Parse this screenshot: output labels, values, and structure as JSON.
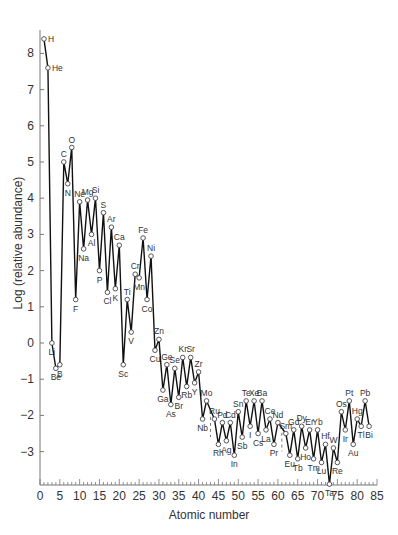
{
  "chart_data": {
    "type": "line",
    "title": "",
    "xlabel": "Atomic number",
    "ylabel": "Log (relative abundance)",
    "xlim": [
      0,
      85
    ],
    "ylim": [
      -3.9,
      8.6
    ],
    "xticks": [
      0,
      5,
      10,
      15,
      20,
      25,
      30,
      35,
      40,
      45,
      50,
      55,
      60,
      65,
      70,
      75,
      80,
      85
    ],
    "yticks": [
      -3,
      -2,
      -1,
      0,
      1,
      2,
      3,
      4,
      5,
      6,
      7,
      8
    ],
    "grid": false,
    "legend": null,
    "series": [
      {
        "name": "Solar system elemental abundance",
        "points": [
          {
            "z": 1,
            "el": "H",
            "v": 8.4
          },
          {
            "z": 2,
            "el": "He",
            "v": 7.6
          },
          {
            "z": 3,
            "el": "Li",
            "v": 0.0
          },
          {
            "z": 4,
            "el": "Be",
            "v": -0.7
          },
          {
            "z": 5,
            "el": "B",
            "v": -0.6
          },
          {
            "z": 6,
            "el": "C",
            "v": 5.0
          },
          {
            "z": 7,
            "el": "N",
            "v": 4.4
          },
          {
            "z": 8,
            "el": "O",
            "v": 5.4
          },
          {
            "z": 9,
            "el": "F",
            "v": 1.2
          },
          {
            "z": 10,
            "el": "Ne",
            "v": 3.9
          },
          {
            "z": 11,
            "el": "Na",
            "v": 2.6
          },
          {
            "z": 12,
            "el": "Mg",
            "v": 3.95
          },
          {
            "z": 13,
            "el": "Al",
            "v": 3.0
          },
          {
            "z": 14,
            "el": "Si",
            "v": 4.0
          },
          {
            "z": 15,
            "el": "P",
            "v": 2.0
          },
          {
            "z": 16,
            "el": "S",
            "v": 3.6
          },
          {
            "z": 17,
            "el": "Cl",
            "v": 1.4
          },
          {
            "z": 18,
            "el": "Ar",
            "v": 3.2
          },
          {
            "z": 19,
            "el": "K",
            "v": 1.5
          },
          {
            "z": 20,
            "el": "Ca",
            "v": 2.7
          },
          {
            "z": 21,
            "el": "Sc",
            "v": -0.6
          },
          {
            "z": 22,
            "el": "Ti",
            "v": 1.2
          },
          {
            "z": 23,
            "el": "V",
            "v": 0.3
          },
          {
            "z": 24,
            "el": "Cr",
            "v": 1.9
          },
          {
            "z": 25,
            "el": "Mn",
            "v": 1.8
          },
          {
            "z": 26,
            "el": "Fe",
            "v": 2.9
          },
          {
            "z": 27,
            "el": "Co",
            "v": 1.2
          },
          {
            "z": 28,
            "el": "Ni",
            "v": 2.4
          },
          {
            "z": 29,
            "el": "Cu",
            "v": -0.2
          },
          {
            "z": 30,
            "el": "Zn",
            "v": 0.1
          },
          {
            "z": 31,
            "el": "Ga",
            "v": -1.3
          },
          {
            "z": 32,
            "el": "Ge",
            "v": -0.6
          },
          {
            "z": 33,
            "el": "As",
            "v": -1.7
          },
          {
            "z": 34,
            "el": "Se",
            "v": -0.7
          },
          {
            "z": 35,
            "el": "Br",
            "v": -1.5
          },
          {
            "z": 36,
            "el": "Kr",
            "v": -0.4
          },
          {
            "z": 37,
            "el": "Rb",
            "v": -1.2
          },
          {
            "z": 38,
            "el": "Sr",
            "v": -0.4
          },
          {
            "z": 39,
            "el": "Y",
            "v": -1.1
          },
          {
            "z": 40,
            "el": "Zr",
            "v": -0.8
          },
          {
            "z": 41,
            "el": "Nb",
            "v": -2.1
          },
          {
            "z": 42,
            "el": "Mo",
            "v": -1.6
          },
          {
            "z": 44,
            "el": "Ru",
            "v": -2.1
          },
          {
            "z": 45,
            "el": "Rh",
            "v": -2.8
          },
          {
            "z": 46,
            "el": "Pd",
            "v": -2.2
          },
          {
            "z": 47,
            "el": "Ag",
            "v": -2.7
          },
          {
            "z": 48,
            "el": "Cd",
            "v": -2.2
          },
          {
            "z": 49,
            "el": "In",
            "v": -3.1
          },
          {
            "z": 50,
            "el": "Sn",
            "v": -1.9
          },
          {
            "z": 51,
            "el": "Sb",
            "v": -2.6
          },
          {
            "z": 52,
            "el": "Te",
            "v": -1.6
          },
          {
            "z": 53,
            "el": "I",
            "v": -2.3
          },
          {
            "z": 54,
            "el": "Xe",
            "v": -1.6
          },
          {
            "z": 55,
            "el": "Cs",
            "v": -2.5
          },
          {
            "z": 56,
            "el": "Ba",
            "v": -1.6
          },
          {
            "z": 57,
            "el": "La",
            "v": -2.4
          },
          {
            "z": 58,
            "el": "Ce",
            "v": -2.1
          },
          {
            "z": 59,
            "el": "Pr",
            "v": -2.8
          },
          {
            "z": 60,
            "el": "Nd",
            "v": -2.2
          },
          {
            "z": 62,
            "el": "Sm",
            "v": -2.5
          },
          {
            "z": 63,
            "el": "Eu",
            "v": -3.1
          },
          {
            "z": 64,
            "el": "Gd",
            "v": -2.4
          },
          {
            "z": 65,
            "el": "Tb",
            "v": -3.2
          },
          {
            "z": 66,
            "el": "Dy",
            "v": -2.3
          },
          {
            "z": 67,
            "el": "Ho",
            "v": -2.9
          },
          {
            "z": 68,
            "el": "Er",
            "v": -2.4
          },
          {
            "z": 69,
            "el": "Tm",
            "v": -3.2
          },
          {
            "z": 70,
            "el": "Yb",
            "v": -2.4
          },
          {
            "z": 71,
            "el": "Lu",
            "v": -3.3
          },
          {
            "z": 72,
            "el": "Hf",
            "v": -2.8
          },
          {
            "z": 73,
            "el": "Ta",
            "v": -3.9
          },
          {
            "z": 74,
            "el": "W",
            "v": -2.9
          },
          {
            "z": 75,
            "el": "Re",
            "v": -3.3
          },
          {
            "z": 76,
            "el": "Os",
            "v": -1.9
          },
          {
            "z": 77,
            "el": "Ir",
            "v": -2.4
          },
          {
            "z": 78,
            "el": "Pt",
            "v": -1.6
          },
          {
            "z": 79,
            "el": "Au",
            "v": -2.8
          },
          {
            "z": 80,
            "el": "Hg",
            "v": -2.1
          },
          {
            "z": 81,
            "el": "Tl",
            "v": -2.3
          },
          {
            "z": 82,
            "el": "Pb",
            "v": -1.6
          },
          {
            "z": 83,
            "el": "Bi",
            "v": -2.3
          }
        ]
      }
    ],
    "annotations": "Each data point labeled with its element symbol; dashed gaps at Z=43 (Tc) and Z=61 (Pm)",
    "gaps": [
      43,
      61
    ]
  }
}
